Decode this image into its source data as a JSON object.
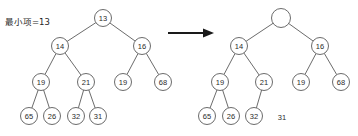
{
  "figure": {
    "caption": "最小项=13",
    "arrow": "right-arrow"
  },
  "left_tree": {
    "name": "original-heap",
    "nodes": [
      {
        "id": "L-root",
        "label": "13",
        "cx": 103,
        "cy": 18,
        "r": 8.5
      },
      {
        "id": "L-14",
        "label": "14",
        "cx": 60,
        "cy": 46,
        "r": 8.5
      },
      {
        "id": "L-16",
        "label": "16",
        "cx": 142,
        "cy": 46,
        "r": 8.5
      },
      {
        "id": "L-19",
        "label": "19",
        "cx": 41,
        "cy": 82,
        "r": 8.5
      },
      {
        "id": "L-21",
        "label": "21",
        "cx": 86,
        "cy": 82,
        "r": 8.5
      },
      {
        "id": "L-19b",
        "label": "19",
        "cx": 123,
        "cy": 82,
        "r": 8.5
      },
      {
        "id": "L-68",
        "label": "68",
        "cx": 163,
        "cy": 82,
        "r": 8.5
      },
      {
        "id": "L-65",
        "label": "65",
        "cx": 29,
        "cy": 116,
        "r": 8.5
      },
      {
        "id": "L-26",
        "label": "26",
        "cx": 52,
        "cy": 116,
        "r": 8.5
      },
      {
        "id": "L-32",
        "label": "32",
        "cx": 76,
        "cy": 116,
        "r": 8.5
      },
      {
        "id": "L-31",
        "label": "31",
        "cx": 98,
        "cy": 116,
        "r": 8.5
      }
    ],
    "edges": [
      [
        "L-root",
        "L-14"
      ],
      [
        "L-root",
        "L-16"
      ],
      [
        "L-14",
        "L-19"
      ],
      [
        "L-14",
        "L-21"
      ],
      [
        "L-16",
        "L-19b"
      ],
      [
        "L-16",
        "L-68"
      ],
      [
        "L-19",
        "L-65"
      ],
      [
        "L-19",
        "L-26"
      ],
      [
        "L-21",
        "L-32"
      ],
      [
        "L-21",
        "L-31"
      ]
    ]
  },
  "right_tree": {
    "name": "heap-after-removal",
    "nodes": [
      {
        "id": "R-root",
        "label": "",
        "cx": 281,
        "cy": 18,
        "r": 9.5
      },
      {
        "id": "R-14",
        "label": "14",
        "cx": 239,
        "cy": 46,
        "r": 8.5
      },
      {
        "id": "R-16",
        "label": "16",
        "cx": 320,
        "cy": 46,
        "r": 8.5
      },
      {
        "id": "R-19",
        "label": "19",
        "cx": 220,
        "cy": 82,
        "r": 8.5
      },
      {
        "id": "R-21",
        "label": "21",
        "cx": 264,
        "cy": 82,
        "r": 8.5
      },
      {
        "id": "R-19b",
        "label": "19",
        "cx": 301,
        "cy": 82,
        "r": 8.5
      },
      {
        "id": "R-68",
        "label": "68",
        "cx": 341,
        "cy": 82,
        "r": 8.5
      },
      {
        "id": "R-65",
        "label": "65",
        "cx": 207,
        "cy": 116,
        "r": 8.5
      },
      {
        "id": "R-26",
        "label": "26",
        "cx": 231,
        "cy": 116,
        "r": 8.5
      },
      {
        "id": "R-32",
        "label": "32",
        "cx": 254,
        "cy": 116,
        "r": 8.5
      }
    ],
    "edges": [
      [
        "R-root",
        "R-14"
      ],
      [
        "R-root",
        "R-16"
      ],
      [
        "R-14",
        "R-19"
      ],
      [
        "R-14",
        "R-21"
      ],
      [
        "R-16",
        "R-19b"
      ],
      [
        "R-16",
        "R-68"
      ],
      [
        "R-19",
        "R-65"
      ],
      [
        "R-19",
        "R-26"
      ],
      [
        "R-21",
        "R-32"
      ]
    ],
    "detached": [
      {
        "id": "R-31",
        "label": "31",
        "cx": 282,
        "cy": 117
      }
    ]
  }
}
